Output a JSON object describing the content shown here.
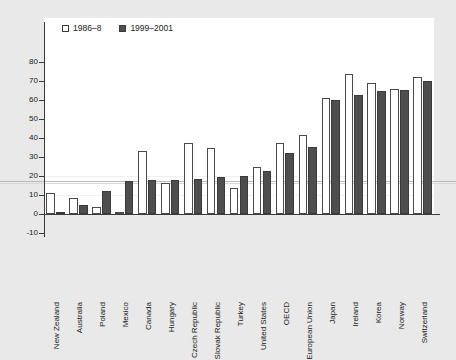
{
  "chart_data": {
    "type": "bar",
    "title": "",
    "subtitle": "",
    "xlabel": "",
    "ylabel": "",
    "ylim": [
      -10,
      80
    ],
    "ytick_step": 10,
    "yticks": [
      "80",
      "70",
      "60",
      "50",
      "40",
      "30",
      "20",
      "10",
      "0",
      "-10"
    ],
    "grid": true,
    "legend_position": "top-left",
    "categories": [
      "New Zealand",
      "Australia",
      "Poland",
      "Mexico",
      "Canada",
      "Hungary",
      "Czech Republic",
      "Slovak Republic",
      "Turkey",
      "United States",
      "OECD",
      "European Union",
      "Japan",
      "Ireland",
      "Korea",
      "Norway",
      "Switzerland"
    ],
    "series": [
      {
        "name": "1986–8",
        "color": "#ffffff",
        "values": [
          11.2,
          8.6,
          3.8,
          0.0,
          33.3,
          16.2,
          37.5,
          34.8,
          13.9,
          25.0,
          37.3,
          41.7,
          61.1,
          73.7,
          69.2,
          65.6,
          72.1
        ]
      },
      {
        "name": "1999–2001",
        "color": "#4e4e4e",
        "values": [
          1.2,
          4.8,
          12.2,
          17.2,
          17.8,
          17.8,
          18.5,
          19.3,
          20.2,
          22.5,
          32.0,
          35.2,
          60.0,
          62.4,
          64.6,
          65.4,
          69.8
        ]
      }
    ]
  },
  "legend": {
    "items": [
      {
        "label": "1986–8",
        "swatch": "open-square-icon"
      },
      {
        "label": "1999–2001",
        "swatch": "filled-square-icon"
      }
    ]
  },
  "colors": {
    "background": "#e9e9e9",
    "panel": "#ffffff",
    "axis": "#3a3a3a",
    "series_old": "#ffffff",
    "series_new": "#4e4e4e",
    "gridline": "#f0f0f0",
    "rule": "#b9b9b9"
  }
}
